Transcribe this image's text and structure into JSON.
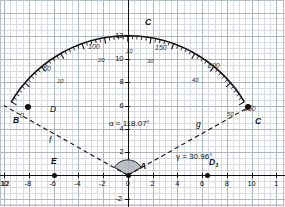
{
  "figure": {
    "type": "geometry-construction"
  },
  "axes": {
    "x_label_values": [
      "12",
      "-10",
      "-8",
      "-6",
      "-4",
      "-2",
      "0",
      "2",
      "4",
      "6",
      "8",
      "10",
      "1"
    ],
    "y_label_values": [
      "12",
      "10",
      "8",
      "6",
      "4",
      "2",
      "-2"
    ],
    "x_range": [
      -12.3,
      11.8
    ],
    "y_range": [
      -2.6,
      13.2
    ],
    "grid": true
  },
  "points": [
    {
      "name": "A",
      "label": "A",
      "x": 0,
      "y": 0,
      "marker": true
    },
    {
      "name": "B",
      "label": "B",
      "x": -10,
      "y": 6,
      "marker": true
    },
    {
      "name": "C",
      "label": "C",
      "x": 10,
      "y": 6,
      "marker": true
    },
    {
      "name": "Capex",
      "label": "C",
      "x": 0,
      "y": 12,
      "marker": false
    },
    {
      "name": "E",
      "label": "E",
      "x": -8,
      "y": 0,
      "marker": true
    },
    {
      "name": "D1",
      "label": "D",
      "sub": "1",
      "x": 6.4,
      "y": 0,
      "marker": true
    }
  ],
  "segments": [
    {
      "name": "f",
      "label": "f",
      "from": "A",
      "to": "B",
      "style": "dashed"
    },
    {
      "name": "g",
      "label": "g",
      "from": "A",
      "to": "C",
      "style": "dashed"
    },
    {
      "name": "D",
      "label": "D",
      "note": "label near B along f",
      "style": "dashed"
    }
  ],
  "angles": [
    {
      "name": "alpha",
      "label": "α = 118.07°",
      "symbol": "α",
      "value": 118.07,
      "unit": "degrees",
      "vertex": "A"
    },
    {
      "name": "gamma",
      "label": "γ = 30.96°",
      "symbol": "γ",
      "value": 30.96,
      "unit": "degrees",
      "vertex": "D1"
    }
  ],
  "protractor": {
    "center_x": 0,
    "center_y": 0.3,
    "radius_units": 11.7,
    "arc_start_deg": 149,
    "arc_end_deg": 31,
    "outer_scale_labels": [
      "0",
      "50",
      "100",
      "150",
      "200",
      "250"
    ],
    "inner_scale_labels": [
      "10",
      "20",
      "30",
      "40",
      "50"
    ],
    "tick_count": 60
  },
  "scale_annotations": [
    {
      "text": "0",
      "x": 20,
      "y": 112,
      "size": "lg"
    },
    {
      "text": "50",
      "x": 43,
      "y": 65,
      "size": "lg"
    },
    {
      "text": "100",
      "x": 88,
      "y": 43,
      "size": "lg"
    },
    {
      "text": "150",
      "x": 155,
      "y": 44,
      "size": "lg"
    },
    {
      "text": "200",
      "x": 208,
      "y": 62,
      "size": "lg"
    },
    {
      "text": "250",
      "x": 244,
      "y": 105,
      "size": "lg"
    },
    {
      "text": "10",
      "x": 57,
      "y": 78,
      "size": "sm"
    },
    {
      "text": "20",
      "x": 98,
      "y": 57,
      "size": "sm"
    },
    {
      "text": "30",
      "x": 147,
      "y": 58,
      "size": "sm"
    },
    {
      "text": "40",
      "x": 192,
      "y": 77,
      "size": "sm"
    },
    {
      "text": "50",
      "x": 227,
      "y": 111,
      "size": "sm"
    },
    {
      "text": "10",
      "x": 126,
      "y": 48,
      "size": "sm"
    }
  ],
  "colors": {
    "grid_minor": "#d8dce2",
    "grid_major": "#aeb6c0",
    "axis": "#111111",
    "arc_stroke": "#111111",
    "angle_fill": "#b9bcc4",
    "text": "#111111"
  }
}
